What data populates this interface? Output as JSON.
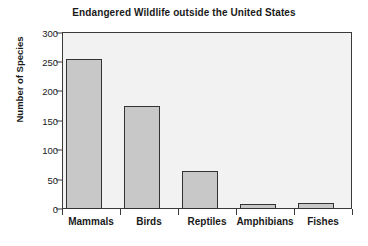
{
  "chart_data": {
    "type": "bar",
    "title": "Endangered Wildlife outside the United States",
    "xlabel": "",
    "ylabel": "Number of Species",
    "categories": [
      "Mammals",
      "Birds",
      "Reptiles",
      "Amphibians",
      "Fishes"
    ],
    "values": [
      255,
      175,
      65,
      9,
      11
    ],
    "ylim": [
      0,
      300
    ],
    "yticks": [
      0,
      50,
      100,
      150,
      200,
      250,
      300
    ],
    "ytick_labels": [
      "0",
      "50",
      "100",
      "150",
      "200",
      "250",
      "300"
    ],
    "grid": false,
    "legend": null,
    "bar_color": "#c8c8c8",
    "bar_edge_color": "#333333",
    "plot_background": "#f2f2f2",
    "axis_color": "#3a3a3a"
  }
}
